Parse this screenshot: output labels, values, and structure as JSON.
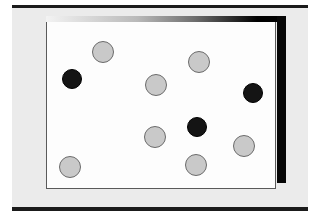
{
  "figure": {
    "canvas": {
      "width": 327,
      "height": 220,
      "background": "#ffffff"
    },
    "panel": {
      "background": "#ebebeb",
      "rule_color": "#1b1b1b"
    },
    "card": {
      "background": "#fdfdfd",
      "border_color": "#5a5a5a"
    },
    "shadow": {
      "right_color": "#060606",
      "top_gradient_start": "#f3f3f3",
      "top_gradient_end": "#000000"
    }
  },
  "dots": {
    "gray_count": 7,
    "black_count": 3,
    "total_count": 10,
    "colors": {
      "gray_fill": "#c9c9c9",
      "gray_stroke": "#6b6b6b",
      "black_fill": "#141414",
      "black_stroke": "#000000"
    },
    "radius": {
      "gray": 11,
      "black": 10
    },
    "items": [
      {
        "x": 103,
        "y": 52,
        "color": "gray"
      },
      {
        "x": 72,
        "y": 79,
        "color": "black"
      },
      {
        "x": 199,
        "y": 62,
        "color": "gray"
      },
      {
        "x": 156,
        "y": 85,
        "color": "gray"
      },
      {
        "x": 253,
        "y": 93,
        "color": "black"
      },
      {
        "x": 197,
        "y": 127,
        "color": "black"
      },
      {
        "x": 155,
        "y": 137,
        "color": "gray"
      },
      {
        "x": 244,
        "y": 146,
        "color": "gray"
      },
      {
        "x": 196,
        "y": 165,
        "color": "gray"
      },
      {
        "x": 70,
        "y": 167,
        "color": "gray"
      }
    ]
  }
}
